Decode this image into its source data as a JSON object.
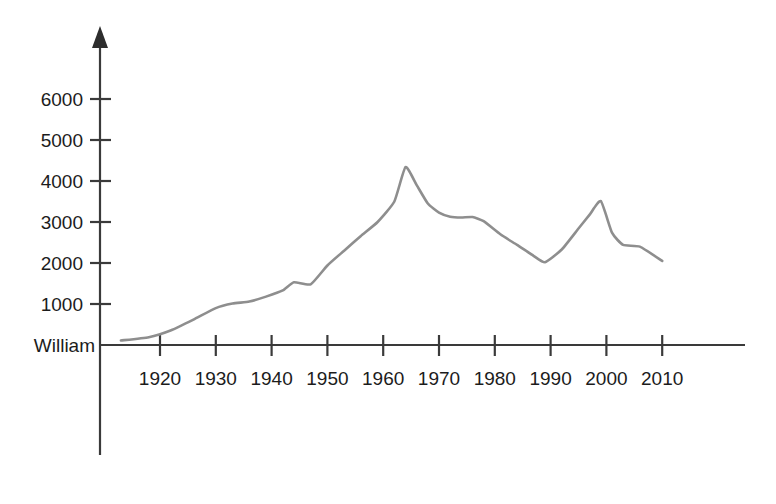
{
  "chart_data": {
    "type": "line",
    "title": "",
    "subtitle": "",
    "xlabel": "",
    "ylabel": "",
    "origin_label": "William",
    "legend": [],
    "legend_position": "none",
    "grid": false,
    "xlim": [
      1912,
      2013
    ],
    "ylim": [
      0,
      6400
    ],
    "x_ticks": [
      1920,
      1930,
      1940,
      1950,
      1960,
      1970,
      1980,
      1990,
      2000,
      2010
    ],
    "x_tick_labels": [
      "1920",
      "1930",
      "1940",
      "1950",
      "1960",
      "1970",
      "1980",
      "1990",
      "2000",
      "2010"
    ],
    "y_ticks": [
      1000,
      2000,
      3000,
      4000,
      5000,
      6000
    ],
    "y_tick_labels": [
      "1000",
      "2000",
      "3000",
      "4000",
      "5000",
      "6000"
    ],
    "line_color": "#8e8e8e",
    "axis_color": "#3a3a3a",
    "series": [
      {
        "name": "William",
        "color": "#8e8e8e",
        "x": [
          1913,
          1918,
          1922,
          1926,
          1930,
          1933,
          1936,
          1939,
          1942,
          1944,
          1947,
          1950,
          1953,
          1956,
          1959,
          1962,
          1964,
          1966,
          1968,
          1970,
          1972,
          1974,
          1976,
          1978,
          1981,
          1984,
          1987,
          1989,
          1992,
          1995,
          1997,
          1999,
          2001,
          2003,
          2006,
          2010
        ],
        "y": [
          110,
          190,
          360,
          620,
          900,
          1010,
          1060,
          1180,
          1330,
          1530,
          1480,
          1940,
          2300,
          2660,
          3000,
          3500,
          4340,
          3900,
          3450,
          3230,
          3130,
          3110,
          3120,
          3020,
          2700,
          2440,
          2170,
          2020,
          2330,
          2840,
          3180,
          3510,
          2740,
          2440,
          2400,
          2050
        ]
      }
    ]
  }
}
